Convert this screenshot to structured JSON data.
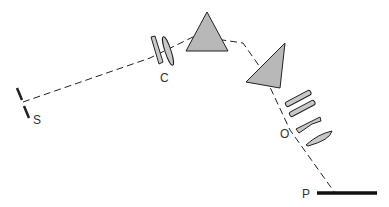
{
  "diagram": {
    "type": "prism spectrograph optical layout",
    "labels": {
      "slit": "S",
      "collimator": "C",
      "objective": "O",
      "plate": "P"
    },
    "colors": {
      "line": "#222222",
      "prism_fill": "#b8b8b8",
      "lens_fill": "#c8c8c8",
      "label": "#333333"
    }
  }
}
